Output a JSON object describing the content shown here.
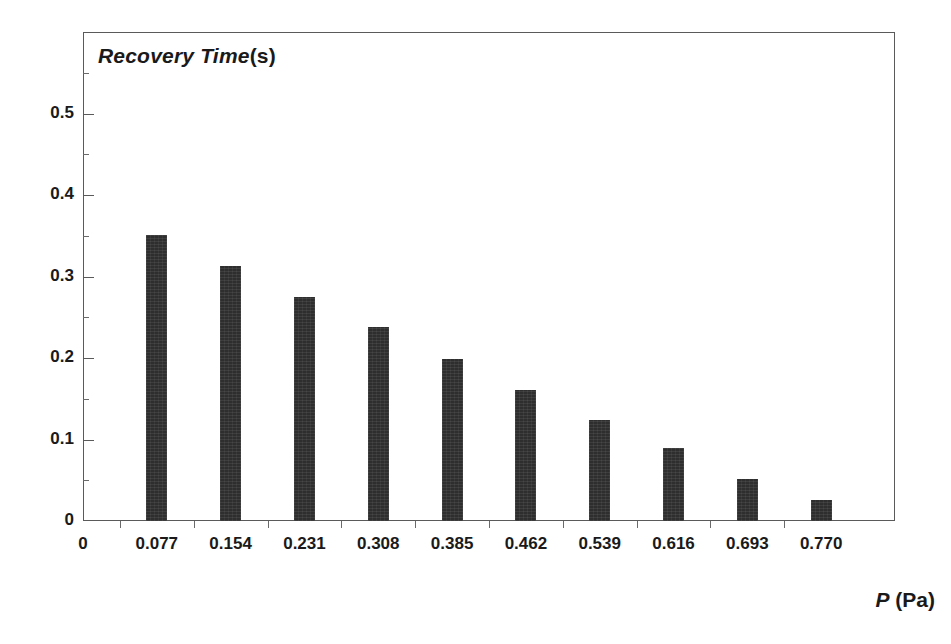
{
  "chart_data": {
    "type": "bar",
    "title_italic_part": "Recovery Time",
    "title_upright_part": "(s)",
    "xlabel": "P (Pa)",
    "xlabel_italic_part": "P",
    "xlabel_upright_part": "(Pa)",
    "ylabel": "Recovery Time (s)",
    "categories": [
      "0.077",
      "0.154",
      "0.231",
      "0.308",
      "0.385",
      "0.462",
      "0.539",
      "0.616",
      "0.693",
      "0.770"
    ],
    "values": [
      0.351,
      0.313,
      0.275,
      0.238,
      0.199,
      0.161,
      0.124,
      0.09,
      0.051,
      0.026
    ],
    "x": [
      0.077,
      0.154,
      0.231,
      0.308,
      0.385,
      0.462,
      0.539,
      0.616,
      0.693,
      0.77
    ],
    "xlim": [
      0,
      0.847
    ],
    "ylim": [
      0,
      0.6
    ],
    "ytick_labels": [
      "0",
      "0.1",
      "0.2",
      "0.3",
      "0.4",
      "0.5"
    ],
    "ytick_values": [
      0,
      0.1,
      0.2,
      0.3,
      0.4,
      0.5
    ],
    "yminor_values": [
      0.05,
      0.15,
      0.25,
      0.35,
      0.45,
      0.55
    ],
    "xtick_labels": [
      "0",
      "0.077",
      "0.154",
      "0.231",
      "0.308",
      "0.385",
      "0.462",
      "0.539",
      "0.616",
      "0.693",
      "0.770"
    ],
    "xtick_values": [
      0,
      0.077,
      0.154,
      0.231,
      0.308,
      0.385,
      0.462,
      0.539,
      0.616,
      0.693,
      0.77
    ],
    "xminor_values": [
      0.0385,
      0.1155,
      0.1925,
      0.2695,
      0.3465,
      0.4235,
      0.5005,
      0.5775,
      0.6545,
      0.7315
    ],
    "grid": false,
    "legend": "none",
    "bar_color": "#2e2e2e",
    "frame_color": "#5a5a5a",
    "background": "#ffffff"
  }
}
